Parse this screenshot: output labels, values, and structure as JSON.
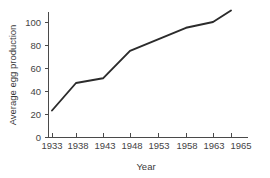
{
  "chart_data": {
    "type": "line",
    "title": "",
    "xlabel": "Year",
    "ylabel": "Average egg production",
    "x": [
      1933,
      1938,
      1943,
      1948,
      1953,
      1958,
      1963,
      1965
    ],
    "values": [
      23,
      47,
      51,
      75,
      85,
      95,
      100,
      110
    ],
    "xtick_labels": [
      "1933",
      "1938",
      "1943",
      "1948",
      "1953",
      "1958",
      "1963",
      "1965"
    ],
    "ytick_labels": [
      "0",
      "20",
      "40",
      "60",
      "80",
      "100"
    ],
    "yticks": [
      0,
      20,
      40,
      60,
      80,
      100
    ],
    "ylim": [
      0,
      115
    ],
    "xlim": [
      1933,
      1966
    ],
    "grid": false,
    "legend": false,
    "line_color": "#2b2b2b",
    "axis_color": "#4a4a4a",
    "background_color": "#ffffff"
  },
  "ytick_positions": {
    "0": 137,
    "20": 114,
    "40": 91,
    "60": 68,
    "80": 45,
    "100": 22
  },
  "xtick_positions": {
    "1933": 52,
    "1938": 76,
    "1943": 103,
    "1948": 130,
    "1953": 158,
    "1958": 186,
    "1963": 213,
    "1965": 231
  }
}
